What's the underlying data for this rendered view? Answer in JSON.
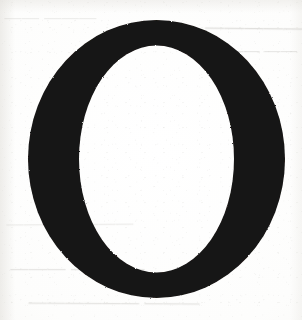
{
  "document": {
    "kind": "scanned-book-page",
    "page_background": "#fdfdfc",
    "ink_color": "#141312",
    "bleedthrough_color": "#b9b7b2",
    "width_px": 302,
    "height_px": 320
  },
  "dropcap": {
    "letter": "O",
    "role": "decorative-initial",
    "typeface_style": "serif",
    "ink_color": "#141312",
    "bounds": {
      "x": 28,
      "y": 20,
      "width": 257,
      "height": 278
    },
    "stroke": {
      "side_px": 51,
      "top_px": 25,
      "bottom_px": 26
    }
  },
  "bleedthrough": {
    "description": "Faint mirrored text showing through from the reverse side of the sheet; not legible.",
    "lines": [
      {
        "id": "top-left",
        "text": "——— ——"
      },
      {
        "id": "top-right-1",
        "text": "——————"
      },
      {
        "id": "top-right-2",
        "text": "—— ———"
      },
      {
        "id": "bottom-1",
        "text": "———  ————"
      },
      {
        "id": "bottom-2",
        "text": "————  ———"
      },
      {
        "id": "bottom-3",
        "text": "——— ——————"
      }
    ]
  }
}
